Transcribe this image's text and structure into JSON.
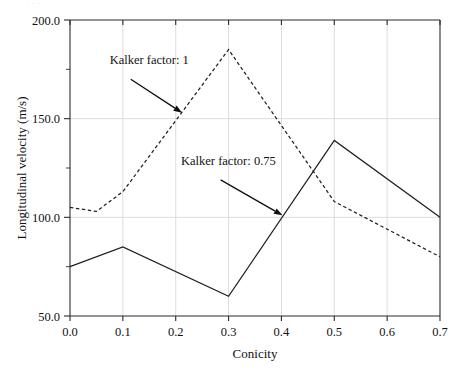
{
  "figure": {
    "scan_artifact": "· · ·"
  },
  "chart_data": {
    "type": "line",
    "title": "",
    "subtitle": "",
    "xlabel": "Conicity",
    "ylabel": "Longitudinal velocity (m/s)",
    "xlim": [
      0.0,
      0.7
    ],
    "ylim": [
      50.0,
      200.0
    ],
    "grid": true,
    "legend_position": "inline-annotations",
    "x_ticks": [
      0.0,
      0.1,
      0.2,
      0.3,
      0.4,
      0.5,
      0.6,
      0.7
    ],
    "x_tick_labels": [
      "0.0",
      "0.1",
      "0.2",
      "0.3",
      "0.4",
      "0.5",
      "0.6",
      "0.7"
    ],
    "y_ticks": [
      50.0,
      100.0,
      150.0,
      200.0
    ],
    "y_tick_labels": [
      "50.0",
      "100.0",
      "150.0",
      "200.0"
    ],
    "y_minor_ticks": [
      75.0,
      125.0,
      175.0
    ],
    "series": [
      {
        "name": "Kalker factor: 1",
        "style": "dashed",
        "color": "#1f1f1f",
        "x": [
          0.0,
          0.05,
          0.1,
          0.3,
          0.5,
          0.7
        ],
        "values": [
          105,
          103,
          113,
          185,
          108,
          80
        ]
      },
      {
        "name": "Kalker factor: 0.75",
        "style": "solid",
        "color": "#1f1f1f",
        "x": [
          0.0,
          0.1,
          0.3,
          0.5,
          0.7
        ],
        "values": [
          75,
          85,
          60,
          139,
          100
        ]
      }
    ],
    "annotations": [
      {
        "label": "Kalker factor: 1",
        "text_x": 0.075,
        "text_y": 177.5,
        "arrow_from_x": 0.115,
        "arrow_from_y": 170.0,
        "arrow_to_x": 0.212,
        "arrow_to_y": 153.0
      },
      {
        "label": "Kalker factor: 0.75",
        "text_x": 0.21,
        "text_y": 126.5,
        "arrow_from_x": 0.285,
        "arrow_from_y": 119.0,
        "arrow_to_x": 0.402,
        "arrow_to_y": 101.0
      }
    ]
  }
}
